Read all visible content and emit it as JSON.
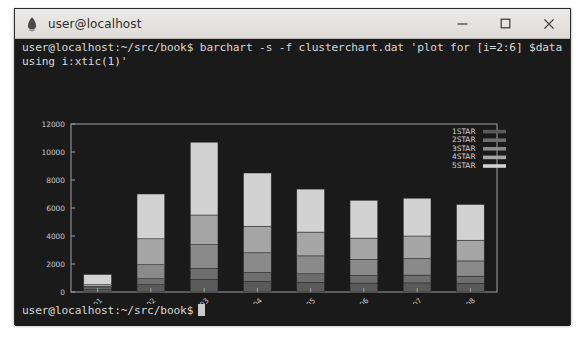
{
  "window": {
    "title": "user@localhost",
    "icon": "gnome-foot-icon",
    "controls": {
      "minimize": "minimize-icon",
      "maximize": "maximize-icon",
      "close": "close-icon"
    }
  },
  "terminal": {
    "command_line": "user@localhost:~/src/book$ barchart -s -f clusterchart.dat 'plot for [i=2:6] $data using i:xtic(1)'",
    "prompt": "user@localhost:~/src/book$",
    "cursor": "block-cursor",
    "background": "#1a1a1a",
    "foreground": "#d8d8d8"
  },
  "chart_data": {
    "type": "bar",
    "variant": "stacked",
    "title": "",
    "xlabel": "",
    "ylabel": "",
    "ylim": [
      0,
      12000
    ],
    "yticks": [
      0,
      2000,
      4000,
      6000,
      8000,
      10000,
      12000
    ],
    "ytick_labels": [
      "0",
      "2000",
      "4000",
      "6000",
      "8000",
      "10000",
      "12000"
    ],
    "grid": false,
    "legend_position": "top-right-inside",
    "categories": [
      "2015-01",
      "2015-02",
      "2015-03",
      "2015-04",
      "2015-05",
      "2015-06",
      "2015-07",
      "2015-08"
    ],
    "xtick_rotation": 45,
    "series": [
      {
        "name": "1STAR",
        "color": "#5a5a5a",
        "values": [
          180,
          520,
          900,
          760,
          700,
          640,
          650,
          610
        ]
      },
      {
        "name": "2STAR",
        "color": "#6e6e6e",
        "values": [
          120,
          430,
          780,
          640,
          600,
          540,
          560,
          520
        ]
      },
      {
        "name": "3STAR",
        "color": "#8a8a8a",
        "values": [
          110,
          1000,
          1700,
          1400,
          1280,
          1150,
          1180,
          1090
        ]
      },
      {
        "name": "4STAR",
        "color": "#a6a6a6",
        "values": [
          110,
          1850,
          2120,
          1900,
          1700,
          1520,
          1610,
          1480
        ]
      },
      {
        "name": "5STAR",
        "color": "#d2d2d2",
        "values": [
          730,
          3200,
          5200,
          3800,
          3070,
          2700,
          2700,
          2550
        ]
      }
    ],
    "totals": [
      1250,
      7000,
      10700,
      8500,
      7350,
      6550,
      6700,
      6250
    ],
    "plot_border_color": "#a0a0a0",
    "background": "#1a1a1a"
  }
}
